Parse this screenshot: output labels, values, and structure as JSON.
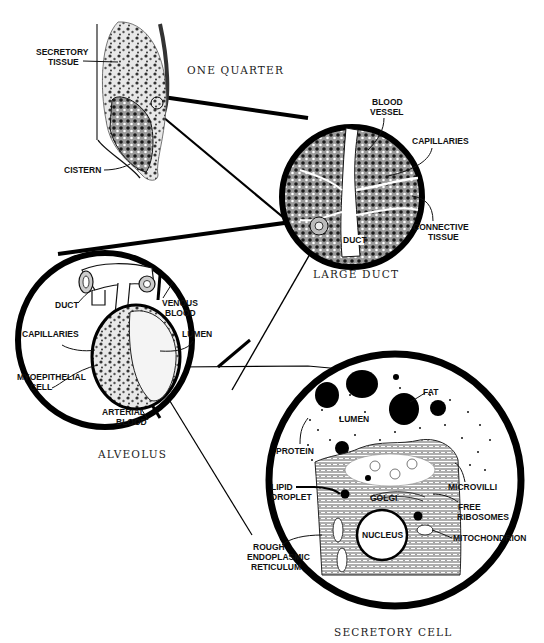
{
  "panels": {
    "quarter": {
      "caption": "ONE QUARTER",
      "labels": {
        "secretory_tissue_1": "SECRETORY",
        "secretory_tissue_2": "TISSUE",
        "cistern": "CISTERN"
      }
    },
    "large_duct": {
      "caption": "LARGE DUCT",
      "labels": {
        "blood_vessel_1": "BLOOD",
        "blood_vessel_2": "VESSEL",
        "capillaries": "CAPILLARIES",
        "connective_tissue_1": "CONNECTIVE",
        "connective_tissue_2": "TISSUE",
        "duct": "DUCT"
      }
    },
    "alveolus": {
      "caption": "ALVEOLUS",
      "labels": {
        "duct": "DUCT",
        "venous_blood_1": "VENOUS",
        "venous_blood_2": "BLOOD",
        "capillaries": "CAPILLARIES",
        "lumen": "LUMEN",
        "myoepithelial_cell_1": "MYOEPITHELIAL",
        "myoepithelial_cell_2": "CELL",
        "arterial_blood_1": "ARTERIAL",
        "arterial_blood_2": "BLOOD"
      }
    },
    "secretory_cell": {
      "caption": "SECRETORY CELL",
      "labels": {
        "fat": "FAT",
        "lumen": "LUMEN",
        "protein": "PROTEIN",
        "lipid_droplet_1": "LIPID",
        "lipid_droplet_2": "DROPLET",
        "golgi": "GOLGI",
        "microvilli": "MICROVILLI",
        "free_ribosomes_1": "FREE",
        "free_ribosomes_2": "RIBOSOMES",
        "nucleus": "NUCLEUS",
        "mitochondrion": "MITOCHONDRION",
        "rough_er_1": "ROUGH",
        "rough_er_2": "ENDOPLASMIC",
        "rough_er_3": "RETICULUM"
      }
    }
  }
}
